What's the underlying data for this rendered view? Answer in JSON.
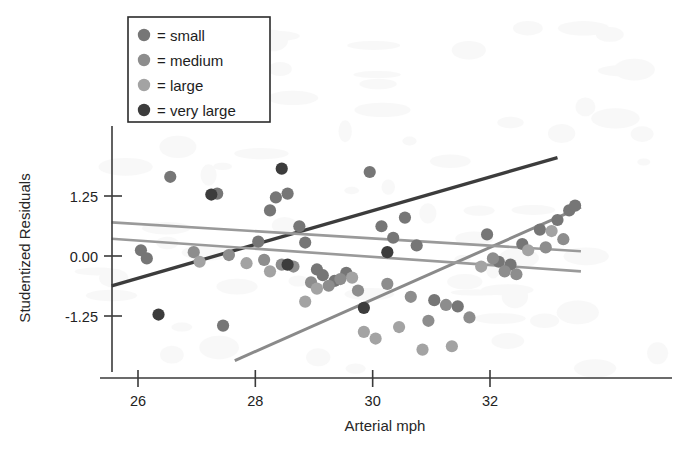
{
  "chart_data": {
    "type": "scatter",
    "title": "",
    "xlabel": "Arterial mph",
    "ylabel": "Studentized Residuals",
    "xlim": [
      25.2,
      33.6
    ],
    "ylim": [
      -2.45,
      2.15
    ],
    "xticks": [
      26,
      28,
      30,
      32
    ],
    "xticklabels": [
      "26",
      "28",
      "30",
      "32"
    ],
    "yticks": [
      1.25,
      0.0,
      -1.25
    ],
    "yticklabels": [
      "1.25",
      "0.00",
      "-1.25"
    ],
    "grid": false,
    "legend_position": "top-left",
    "legend_title": "",
    "series": [
      {
        "name": "small",
        "legend_text": "= small",
        "color": "#767676",
        "marker": "circle",
        "points": [
          [
            26.05,
            0.12
          ],
          [
            26.15,
            -0.05
          ],
          [
            26.55,
            1.65
          ],
          [
            27.35,
            1.3
          ],
          [
            27.45,
            -1.45
          ],
          [
            28.05,
            0.3
          ],
          [
            28.25,
            0.95
          ],
          [
            28.35,
            1.22
          ],
          [
            28.55,
            1.3
          ],
          [
            28.75,
            0.62
          ],
          [
            28.85,
            0.28
          ],
          [
            29.05,
            -0.28
          ],
          [
            29.15,
            -0.4
          ],
          [
            29.35,
            -0.52
          ],
          [
            29.55,
            -0.35
          ],
          [
            29.95,
            1.75
          ],
          [
            30.15,
            0.62
          ],
          [
            30.35,
            0.38
          ],
          [
            30.55,
            0.8
          ],
          [
            30.75,
            0.22
          ],
          [
            31.05,
            -0.92
          ],
          [
            31.45,
            -1.05
          ],
          [
            31.95,
            0.45
          ],
          [
            32.15,
            -0.12
          ],
          [
            32.35,
            -0.18
          ],
          [
            32.55,
            0.25
          ],
          [
            32.85,
            0.55
          ],
          [
            33.15,
            0.75
          ],
          [
            33.35,
            0.95
          ],
          [
            33.45,
            1.05
          ]
        ]
      },
      {
        "name": "medium",
        "legend_text": "= medium",
        "color": "#8d8d8d",
        "marker": "circle",
        "points": [
          [
            26.95,
            0.08
          ],
          [
            27.55,
            0.02
          ],
          [
            28.15,
            -0.08
          ],
          [
            28.45,
            -0.18
          ],
          [
            28.65,
            -0.22
          ],
          [
            28.95,
            -0.55
          ],
          [
            29.25,
            -0.62
          ],
          [
            29.45,
            -0.48
          ],
          [
            29.75,
            -0.72
          ],
          [
            30.25,
            -0.58
          ],
          [
            30.65,
            -0.85
          ],
          [
            30.95,
            -1.35
          ],
          [
            31.25,
            -1.02
          ],
          [
            31.65,
            -1.28
          ],
          [
            32.05,
            -0.05
          ],
          [
            32.25,
            -0.32
          ],
          [
            32.45,
            -0.38
          ],
          [
            32.95,
            0.18
          ],
          [
            33.25,
            0.35
          ]
        ]
      },
      {
        "name": "large",
        "legend_text": "= large",
        "color": "#a3a3a3",
        "marker": "circle",
        "points": [
          [
            27.05,
            -0.12
          ],
          [
            27.85,
            -0.15
          ],
          [
            28.25,
            -0.32
          ],
          [
            28.85,
            -0.95
          ],
          [
            29.05,
            -0.68
          ],
          [
            29.65,
            -0.45
          ],
          [
            29.85,
            -1.58
          ],
          [
            30.05,
            -1.72
          ],
          [
            30.45,
            -1.48
          ],
          [
            30.85,
            -1.95
          ],
          [
            31.35,
            -1.88
          ],
          [
            31.85,
            -0.22
          ],
          [
            32.65,
            0.12
          ],
          [
            33.05,
            0.52
          ]
        ]
      },
      {
        "name": "very large",
        "legend_text": "= very large",
        "color": "#3c3c3c",
        "marker": "circle",
        "points": [
          [
            26.35,
            -1.22
          ],
          [
            27.25,
            1.28
          ],
          [
            28.45,
            1.82
          ],
          [
            28.55,
            -0.18
          ],
          [
            29.85,
            -1.08
          ],
          [
            30.25,
            0.08
          ]
        ]
      }
    ],
    "fit_lines": [
      {
        "name": "very-large-fit",
        "color": "#3c3c3c",
        "width": 3.4,
        "x": [
          25.55,
          33.15
        ],
        "y": [
          -0.62,
          2.05
        ]
      },
      {
        "name": "large-fit",
        "color": "#8a8a8a",
        "width": 3.0,
        "x": [
          27.65,
          33.55
        ],
        "y": [
          -2.18,
          1.02
        ]
      },
      {
        "name": "small-fit",
        "color": "#9a9a9a",
        "width": 2.6,
        "x": [
          25.55,
          33.55
        ],
        "y": [
          0.7,
          0.1
        ]
      },
      {
        "name": "medium-fit",
        "color": "#9a9a9a",
        "width": 2.6,
        "x": [
          25.55,
          33.55
        ],
        "y": [
          0.36,
          -0.32
        ]
      }
    ]
  }
}
